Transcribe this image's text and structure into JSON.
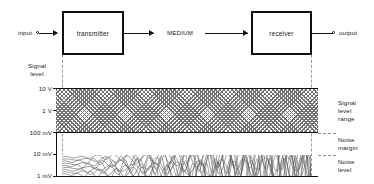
{
  "diagram": {
    "blocks": [
      {
        "id": "transmitter",
        "label": "transmitter"
      },
      {
        "id": "receiver",
        "label": "receiver"
      }
    ],
    "terminals": [
      {
        "id": "input",
        "label": "input"
      },
      {
        "id": "output",
        "label": "output"
      }
    ],
    "medium_label": "MEDIUM",
    "axis": {
      "title_line1": "Signal",
      "title_line2": "level",
      "ticks": [
        {
          "label": "10 V",
          "value": 10,
          "unit": "V"
        },
        {
          "label": "1 V",
          "value": 1,
          "unit": "V"
        },
        {
          "label": "100 mV",
          "value": 0.1,
          "unit": "V"
        },
        {
          "label": "10 mV",
          "value": 0.01,
          "unit": "V"
        },
        {
          "label": "1 mV",
          "value": 0.001,
          "unit": "V"
        }
      ]
    },
    "regions": [
      {
        "id": "signal-level-range",
        "line1": "Signal",
        "line2": "level",
        "line3": "range"
      },
      {
        "id": "noise-margin",
        "line1": "Noise",
        "line2": "margin"
      },
      {
        "id": "noise-level",
        "line1": "Noise",
        "line2": "level"
      }
    ]
  },
  "colors": {
    "ink": "#111111",
    "hatch": "#737373",
    "dashed": "#9a9a9a",
    "background": "#ffffff"
  }
}
